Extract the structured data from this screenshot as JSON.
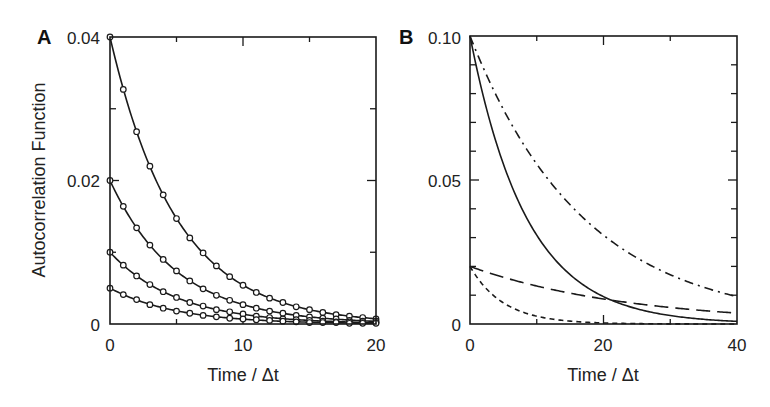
{
  "chart_data": [
    {
      "panel": "A",
      "type": "line",
      "title": "",
      "xlabel": "Time / Δt",
      "ylabel": "Autocorrelation Function",
      "xlim": [
        0,
        20
      ],
      "ylim": [
        0,
        0.04
      ],
      "xticks": [
        0,
        10,
        20
      ],
      "xticks_minor": [
        5,
        15
      ],
      "yticks": [
        0,
        0.02,
        0.04
      ],
      "ytick_labels": [
        "0",
        "0.02",
        "0.04"
      ],
      "yticks_minor": [
        0.01,
        0.03
      ],
      "grid": false,
      "legend": null,
      "markers": "open-circle",
      "x": [
        0,
        1,
        2,
        3,
        4,
        5,
        6,
        7,
        8,
        9,
        10,
        11,
        12,
        13,
        14,
        15,
        16,
        17,
        18,
        19,
        20
      ],
      "series": [
        {
          "name": "A0=0.04",
          "amplitude": 0.04,
          "tau": 5,
          "style": "solid",
          "values": [
            0.04,
            0.0327,
            0.0268,
            0.022,
            0.018,
            0.0147,
            0.012,
            0.0099,
            0.0081,
            0.0066,
            0.0054,
            0.0044,
            0.0036,
            0.003,
            0.0024,
            0.002,
            0.0016,
            0.0013,
            0.0011,
            0.0009,
            0.0007
          ]
        },
        {
          "name": "A0=0.02",
          "amplitude": 0.02,
          "tau": 5,
          "style": "solid",
          "values": [
            0.02,
            0.0164,
            0.0134,
            0.011,
            0.009,
            0.0074,
            0.006,
            0.0049,
            0.004,
            0.0033,
            0.0027,
            0.0022,
            0.0018,
            0.0015,
            0.0012,
            0.001,
            0.0008,
            0.0007,
            0.0005,
            0.0004,
            0.0004
          ]
        },
        {
          "name": "A0=0.01",
          "amplitude": 0.01,
          "tau": 5,
          "style": "solid",
          "values": [
            0.01,
            0.0082,
            0.0067,
            0.0055,
            0.0045,
            0.0037,
            0.003,
            0.0025,
            0.002,
            0.0017,
            0.0014,
            0.0011,
            0.0009,
            0.0007,
            0.0006,
            0.0005,
            0.0004,
            0.0003,
            0.0003,
            0.0002,
            0.0002
          ]
        },
        {
          "name": "A0=0.005",
          "amplitude": 0.005,
          "tau": 5,
          "style": "solid",
          "values": [
            0.005,
            0.0041,
            0.0034,
            0.0027,
            0.0022,
            0.0018,
            0.0015,
            0.0012,
            0.001,
            0.0008,
            0.0007,
            0.0006,
            0.0005,
            0.0004,
            0.0003,
            0.0002,
            0.0002,
            0.0002,
            0.0001,
            0.0001,
            0.0001
          ]
        }
      ]
    },
    {
      "panel": "B",
      "type": "line",
      "title": "",
      "xlabel": "Time / Δt",
      "ylabel": "",
      "xlim": [
        0,
        40
      ],
      "ylim": [
        0,
        0.1
      ],
      "xticks": [
        0,
        20,
        40
      ],
      "xticks_minor": [
        10,
        30
      ],
      "yticks": [
        0,
        0.05,
        0.1
      ],
      "ytick_labels": [
        "0",
        "0.05",
        "0.10"
      ],
      "yticks_minor": [
        0.01,
        0.02,
        0.03,
        0.04,
        0.06,
        0.07,
        0.08,
        0.09
      ],
      "grid": false,
      "legend": null,
      "series": [
        {
          "name": "solid",
          "amplitude": 0.1,
          "tau": 8.5,
          "style": "solid",
          "x": [
            0,
            5,
            10,
            15,
            20,
            25,
            30,
            35,
            40
          ],
          "values": [
            0.1,
            0.0555,
            0.0308,
            0.0171,
            0.0095,
            0.0053,
            0.0029,
            0.0016,
            0.0009
          ]
        },
        {
          "name": "dash-dot",
          "amplitude": 0.1,
          "tau": 17,
          "style": "dash-dot",
          "x": [
            0,
            5,
            10,
            15,
            20,
            25,
            30,
            35,
            40
          ],
          "values": [
            0.1,
            0.0745,
            0.0555,
            0.0414,
            0.0308,
            0.023,
            0.0171,
            0.0128,
            0.0095
          ]
        },
        {
          "name": "long-dash",
          "amplitude": 0.02,
          "tau": 24,
          "style": "long-dash",
          "x": [
            0,
            5,
            10,
            15,
            20,
            25,
            30,
            35,
            40
          ],
          "values": [
            0.02,
            0.0162,
            0.0132,
            0.0107,
            0.0087,
            0.007,
            0.0057,
            0.0046,
            0.0038
          ]
        },
        {
          "name": "short-dash",
          "amplitude": 0.02,
          "tau": 5,
          "style": "short-dash",
          "x": [
            0,
            5,
            10,
            15,
            20,
            25,
            30,
            35,
            40
          ],
          "values": [
            0.02,
            0.0074,
            0.0027,
            0.001,
            0.0004,
            0.0001,
            0.0,
            0.0,
            0.0
          ]
        }
      ]
    }
  ],
  "panels": {
    "A": {
      "letter": "A",
      "xlabel": "Time / Δt",
      "ylabel": "Autocorrelation Function",
      "xtick_labels": [
        "0",
        "10",
        "20"
      ],
      "ytick_labels": [
        "0",
        "0.02",
        "0.04"
      ]
    },
    "B": {
      "letter": "B",
      "xlabel": "Time / Δt",
      "xtick_labels": [
        "0",
        "20",
        "40"
      ],
      "ytick_labels": [
        "0",
        "0.05",
        "0.10"
      ]
    }
  },
  "colors": {
    "line": "#1a1a1a",
    "background": "#ffffff",
    "marker_fill": "#ffffff"
  }
}
